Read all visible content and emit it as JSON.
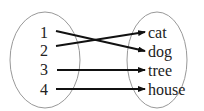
{
  "diagram": {
    "type": "function-mapping",
    "domain": [
      "1",
      "2",
      "3",
      "4"
    ],
    "codomain": [
      "cat",
      "dog",
      "tree",
      "house"
    ],
    "mappings": [
      {
        "from": "1",
        "to": "dog"
      },
      {
        "from": "2",
        "to": "cat"
      },
      {
        "from": "3",
        "to": "tree"
      },
      {
        "from": "4",
        "to": "house"
      }
    ],
    "colors": {
      "ellipse_stroke": "#999999",
      "arrow": "#111111",
      "text": "#222222"
    }
  }
}
